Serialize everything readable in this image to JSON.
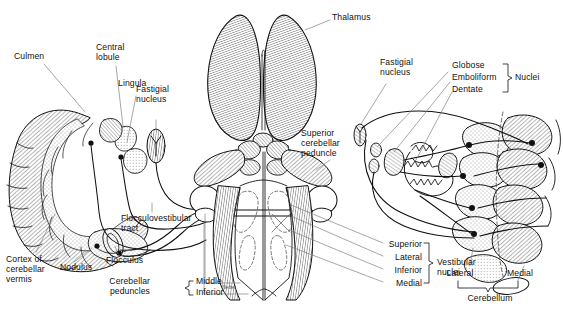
{
  "figure": {
    "signature": "Netter",
    "ink": "#111111",
    "paper": "#ffffff",
    "stipple": "#cfcfcf",
    "hatch": "#8a8a8a"
  },
  "panels": {
    "left": {
      "name": "Midsagittal section of cerebellum",
      "labels": [
        {
          "id": "culmen",
          "text": "Culmen",
          "x": 16,
          "y": 56,
          "align": "left"
        },
        {
          "id": "central-lobule",
          "text": "Central\nlobule",
          "x": 96,
          "y": 46,
          "align": "left"
        },
        {
          "id": "lingula",
          "text": "Lingula",
          "x": 119,
          "y": 82,
          "align": "left"
        },
        {
          "id": "fastigial",
          "text": "Fastigial\nnucleus",
          "x": 137,
          "y": 107,
          "align": "left"
        },
        {
          "id": "cortex-vermis",
          "text": "Cortex of\ncerebellar\nvermis",
          "x": 8,
          "y": 254,
          "align": "left"
        },
        {
          "id": "nodulus",
          "text": "Nodulus",
          "x": 61,
          "y": 265,
          "align": "left"
        },
        {
          "id": "flocculus",
          "text": "Flocculus",
          "x": 107,
          "y": 258,
          "align": "left"
        },
        {
          "id": "flocculovestibular",
          "text": "Flocculovestibular\ntract",
          "x": 121,
          "y": 215,
          "align": "left"
        }
      ]
    },
    "center": {
      "name": "Dorsal view of brainstem and thalamus",
      "labels": [
        {
          "id": "thalamus",
          "text": "Thalamus",
          "x": 331,
          "y": 15,
          "align": "left"
        },
        {
          "id": "scp",
          "text": "Superior\ncerebellar\npeduncle",
          "x": 302,
          "y": 131,
          "align": "left"
        }
      ],
      "brackets": {
        "peduncles": {
          "title": "Cerebellar\npeduncles",
          "title_x": 136,
          "title_y": 287,
          "items": [
            "Middle",
            "Inferior"
          ],
          "items_x": 196,
          "items_y": 287
        },
        "vestibular": {
          "title": "Vestibular\nnuclei",
          "title_x": 398,
          "title_y": 262,
          "items": [
            "Superior",
            "Lateral",
            "Inferior",
            "Medial"
          ],
          "items_x": 386,
          "items_y": 244
        }
      }
    },
    "right": {
      "name": "Cerebellar nuclei and their cortical projections",
      "labels": [
        {
          "id": "fastigial-nucleus-r",
          "text": "Fastigial\nnucleus",
          "x": 381,
          "y": 60,
          "align": "left"
        }
      ],
      "brackets": {
        "nuclei": {
          "title": "Nuclei",
          "title_x": 512,
          "title_y": 79,
          "items": [
            "Globose",
            "Emboliform",
            "Dentate"
          ],
          "items_x": 453,
          "items_y": 67
        },
        "cerebellum": {
          "title": "Cerebellum",
          "title_x": 452,
          "title_y": 296,
          "items": [
            "Lateral",
            "Medial"
          ],
          "left_x": 455,
          "right_x": 512,
          "items_y": 270
        }
      }
    }
  }
}
